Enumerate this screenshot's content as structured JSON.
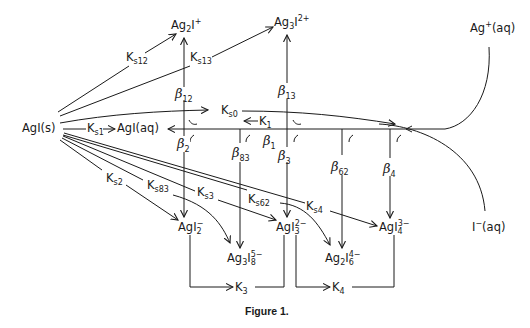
{
  "figure": {
    "caption": "Figure 1."
  },
  "species": {
    "agi_s": "AgI(s)",
    "agi_aq": "AgI(aq)",
    "ag_aq": {
      "base": "Ag",
      "sup": "+",
      "suffix": "(aq)"
    },
    "i_aq": {
      "base": "I",
      "sup": "−",
      "suffix": "(aq)"
    },
    "ag2i": {
      "a": "Ag",
      "a_sub": "2",
      "b": "I",
      "sup": "+"
    },
    "ag3i2": {
      "a": "Ag",
      "a_sub": "3",
      "b": "I",
      "sup": "2+"
    },
    "agi2": {
      "a": "AgI",
      "sub": "2",
      "sup": "−"
    },
    "agi3": {
      "a": "AgI",
      "sub": "3",
      "sup": "2−"
    },
    "agi4": {
      "a": "AgI",
      "sub": "4",
      "sup": "3−"
    },
    "ag3i8": {
      "a": "Ag",
      "a_sub": "3",
      "b": "I",
      "sub": "8",
      "sup": "5−"
    },
    "ag2i6": {
      "a": "Ag",
      "a_sub": "2",
      "b": "I",
      "sub": "6",
      "sup": "4−"
    }
  },
  "constants": {
    "ks0": {
      "base": "K",
      "sub": "s0"
    },
    "ks1": {
      "base": "K",
      "sub": "s1"
    },
    "k1": {
      "base": "K",
      "sub": "1"
    },
    "ks12": {
      "base": "K",
      "sub": "s12"
    },
    "ks13": {
      "base": "K",
      "sub": "s13"
    },
    "ks2": {
      "base": "K",
      "sub": "s2"
    },
    "ks83": {
      "base": "K",
      "sub": "s83"
    },
    "ks3": {
      "base": "K",
      "sub": "s3"
    },
    "ks62": {
      "base": "K",
      "sub": "s62"
    },
    "ks4": {
      "base": "K",
      "sub": "s4"
    },
    "k3": {
      "base": "K",
      "sub": "3"
    },
    "k4": {
      "base": "K",
      "sub": "4"
    }
  },
  "betas": {
    "b12": {
      "base": "β",
      "sub": "12"
    },
    "b13": {
      "base": "β",
      "sub": "13"
    },
    "b1": {
      "base": "β",
      "sub": "1"
    },
    "b2": {
      "base": "β",
      "sub": "2"
    },
    "b83": {
      "base": "β",
      "sub": "83"
    },
    "b3": {
      "base": "β",
      "sub": "3"
    },
    "b62": {
      "base": "β",
      "sub": "62"
    },
    "b4": {
      "base": "β",
      "sub": "4"
    }
  },
  "colors": {
    "ink": "#1a1a1a",
    "background": "#ffffff"
  }
}
